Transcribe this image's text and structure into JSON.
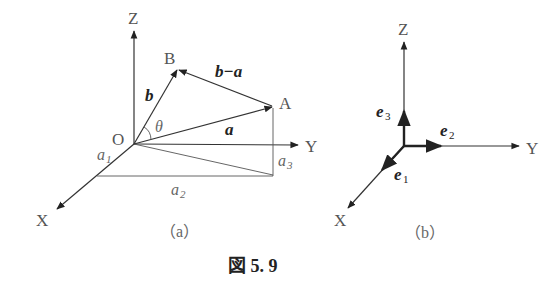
{
  "figure": {
    "caption": "図 5. 9",
    "panel_a": {
      "label": "（a）",
      "axes": {
        "x": "X",
        "y": "Y",
        "z": "Z"
      },
      "origin": "O",
      "points": {
        "A": "A",
        "B": "B"
      },
      "vectors": {
        "a": "a",
        "b": "b",
        "b_minus_a": "b−a"
      },
      "angle": "θ",
      "components": {
        "a1": "a",
        "a1_sub": "1",
        "a2": "a",
        "a2_sub": "2",
        "a3": "a",
        "a3_sub": "3"
      }
    },
    "panel_b": {
      "label": "（b）",
      "axes": {
        "x": "X",
        "y": "Y",
        "z": "Z"
      },
      "unit_vectors": {
        "e1": "e",
        "e1_sub": "1",
        "e2": "e",
        "e2_sub": "2",
        "e3": "e",
        "e3_sub": "3"
      }
    }
  },
  "colors": {
    "line": "#333333",
    "label": "#555555",
    "bold": "#222222"
  }
}
